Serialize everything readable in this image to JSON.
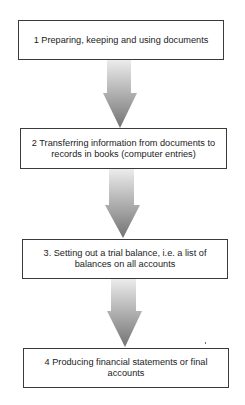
{
  "diagram": {
    "type": "vertical-flowchart",
    "steps": [
      {
        "label": "1 Preparing, keeping and using documents"
      },
      {
        "label": "2 Transferring information from documents to records in books (computer entries)"
      },
      {
        "label": "3. Setting out a trial balance, i.e. a list of balances on all accounts"
      },
      {
        "label": "4 Producing financial statements or final accounts"
      }
    ],
    "connectors": [
      {
        "from": 1,
        "to": 2,
        "style": "gradient-arrow"
      },
      {
        "from": 2,
        "to": 3,
        "style": "gradient-arrow"
      },
      {
        "from": 3,
        "to": 4,
        "style": "gradient-arrow"
      }
    ],
    "colors": {
      "box_border": "#3a3a3a",
      "arrow_light": "#e6e6e6",
      "arrow_dark": "#7a7a7a",
      "text": "#222222"
    }
  }
}
